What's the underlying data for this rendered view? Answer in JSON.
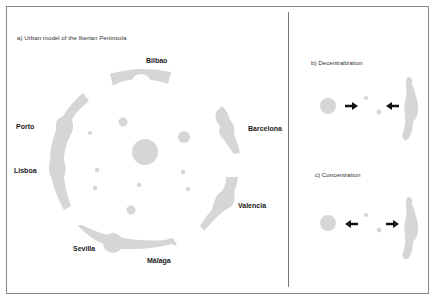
{
  "colors": {
    "frame": "#8a8a8a",
    "divider": "#777777",
    "shape_fill": "#d6d6d6",
    "arrow": "#111111",
    "text": "#1a1a1a"
  },
  "panel_a": {
    "title": "a) Urban model of the Iberian Peninsula",
    "cities": {
      "bilbao": "Bilbao",
      "barcelona": "Barcelona",
      "valencia": "Valencia",
      "malaga": "Málaga",
      "sevilla": "Sevilla",
      "lisboa": "Lisboa",
      "porto": "Porto"
    }
  },
  "panel_b": {
    "title": "b) Decentralization",
    "arrows": [
      "right",
      "left"
    ]
  },
  "panel_c": {
    "title": "c) Concentration",
    "arrows": [
      "left",
      "right"
    ]
  }
}
